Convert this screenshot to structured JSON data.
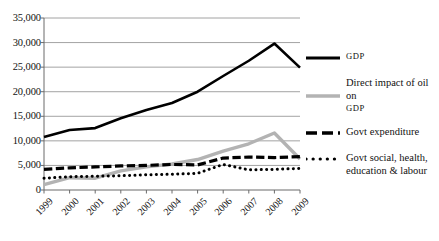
{
  "chart_data": {
    "type": "line",
    "title": "",
    "xlabel": "",
    "ylabel": "",
    "grid": true,
    "legend_position": "right",
    "categories": [
      "1999",
      "2000",
      "2001",
      "2002",
      "2003",
      "2004",
      "2005",
      "2006",
      "2007",
      "2008",
      "2009"
    ],
    "x": [
      1999,
      2000,
      2001,
      2002,
      2003,
      2004,
      2005,
      2006,
      2007,
      2008,
      2009
    ],
    "ylim": [
      0,
      35000
    ],
    "ytick_values": [
      0,
      5000,
      10000,
      15000,
      20000,
      25000,
      30000,
      35000
    ],
    "ytick_labels": [
      "0",
      "5,000",
      "10,000",
      "15,000",
      "20,000",
      "25,000",
      "30,000",
      "35,000"
    ],
    "series": [
      {
        "name": "GDP",
        "style": "solid",
        "color": "#000000",
        "width": 2.6,
        "values": [
          10800,
          12200,
          12600,
          14600,
          16300,
          17700,
          20000,
          23200,
          26300,
          29800,
          24900
        ]
      },
      {
        "name": "Direct impact of oil on GDP",
        "style": "solid",
        "color": "#b3b3b3",
        "width": 3.4,
        "values": [
          1100,
          2500,
          2400,
          3900,
          4700,
          5300,
          6200,
          7900,
          9400,
          11600,
          6300
        ]
      },
      {
        "name": "Govt expenditure",
        "style": "dashed",
        "color": "#000000",
        "width": 3.2,
        "values": [
          4200,
          4500,
          4700,
          4900,
          5000,
          5200,
          5100,
          6500,
          6700,
          6600,
          6800
        ]
      },
      {
        "name": "Govt social, health, education & labour",
        "style": "dotted",
        "color": "#000000",
        "width": 3.0,
        "values": [
          2400,
          2700,
          2800,
          2900,
          3100,
          3200,
          3400,
          5200,
          4100,
          4200,
          4400
        ]
      }
    ]
  },
  "legend": {
    "items": [
      {
        "label": "GDP",
        "label2": "",
        "style": "solid",
        "color": "#000000",
        "smallcaps": true
      },
      {
        "label": "Direct impact of oil on",
        "label2": "GDP",
        "style": "solid",
        "color": "#b3b3b3",
        "smallcaps": false
      },
      {
        "label": "Govt expenditure",
        "label2": "",
        "style": "dashed",
        "color": "#000000",
        "smallcaps": false
      },
      {
        "label": "Govt social, health,",
        "label2": "education & labour",
        "style": "dotted",
        "color": "#000000",
        "smallcaps": false
      }
    ]
  }
}
